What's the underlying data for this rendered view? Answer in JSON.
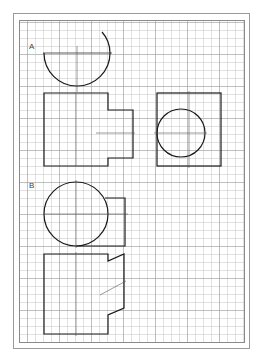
{
  "sheet": {
    "background": "#ffffff",
    "border_color": "#8a8a8a",
    "grid": "graph-paper"
  },
  "labels": {
    "a": "A",
    "b": "B"
  },
  "figures": {
    "a": {
      "top_view": "semicircle",
      "front_view": "stepped-rectangle",
      "side_view": "rectangle-with-circle"
    },
    "b": {
      "top_view": "circle-with-rectangle",
      "front_view": "rectangle-with-angled-notch"
    }
  },
  "colors": {
    "line": "#1a1a1a",
    "centerline": "#555555"
  }
}
